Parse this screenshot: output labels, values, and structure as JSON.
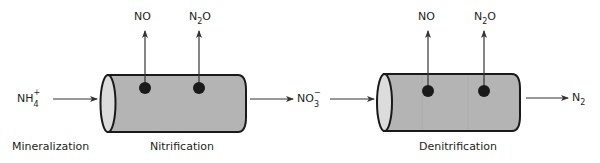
{
  "diagram": {
    "colors": {
      "cylinder_body": "#b4b4b4",
      "cylinder_cap": "#dcdcdc",
      "outline": "#1a1a1a",
      "dot": "#1a1a1a",
      "arrow": "#333333",
      "text": "#231f20"
    },
    "species": {
      "ammonium": {
        "base": "NH",
        "sub": "4",
        "sup": "+"
      },
      "nitrate": {
        "base": "NO",
        "sub": "3",
        "sup": "−"
      },
      "dinitrogen": {
        "base": "N",
        "sub": "2"
      },
      "nitric_oxide_1": {
        "text": "NO"
      },
      "nitrous_oxide_1": {
        "base": "N",
        "sub": "2",
        "rest": "O"
      },
      "nitric_oxide_2": {
        "text": "NO"
      },
      "nitrous_oxide_2": {
        "base": "N",
        "sub": "2",
        "rest": "O"
      }
    },
    "process_labels": {
      "mineralization": "Mineralization",
      "nitrification": "Nitrification",
      "denitrification": "Denitrification"
    }
  }
}
